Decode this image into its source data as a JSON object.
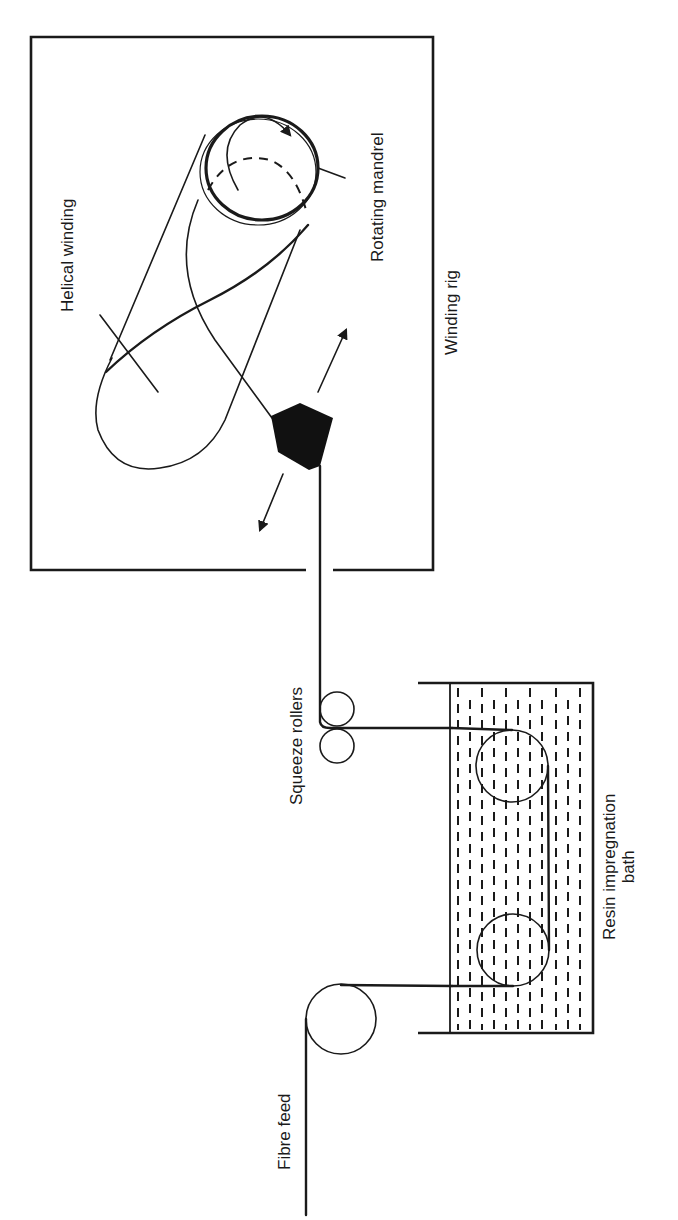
{
  "diagram": {
    "orientation": "rotated 90 degrees counter-clockwise",
    "colors": {
      "ink": "#1a1a1a",
      "background": "#ffffff"
    },
    "labels": {
      "fibre_feed": "Fibre feed",
      "resin_bath": "Resin impregnation",
      "resin_bath_2": "bath",
      "squeeze_rollers": "Squeeze rollers",
      "winding_rig": "Winding rig",
      "helical_winding": "Helical winding",
      "rotating_mandrel": "Rotating mandrel"
    },
    "components": [
      {
        "id": "fibre-feed-roller",
        "label": "Fibre feed"
      },
      {
        "id": "resin-impregnation-bath",
        "label": "Resin impregnation bath",
        "rollers": 2
      },
      {
        "id": "squeeze-rollers",
        "label": "Squeeze rollers",
        "rollers": 2
      },
      {
        "id": "traversing-guide",
        "label": "",
        "motion": "reciprocating (two-headed arrows)"
      },
      {
        "id": "rotating-mandrel",
        "label": "Rotating mandrel",
        "motion": "rotation arrow"
      },
      {
        "id": "winding-rig",
        "label": "Winding rig"
      }
    ],
    "flow": [
      "Fibre feed",
      "Resin impregnation bath",
      "Squeeze rollers",
      "Winding rig",
      "Rotating mandrel"
    ]
  }
}
